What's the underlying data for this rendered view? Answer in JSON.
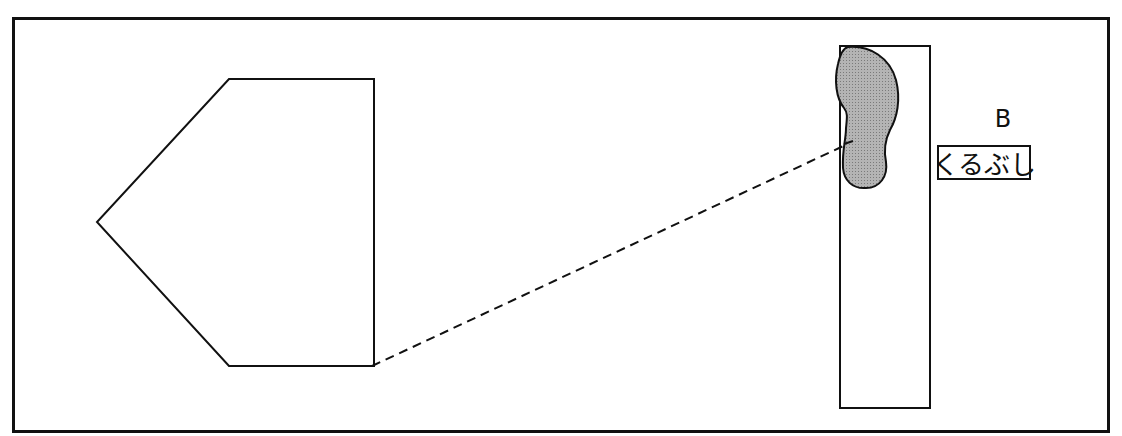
{
  "diagram": {
    "label": {
      "letter": "B",
      "text": "くるぶし"
    },
    "colors": {
      "stroke": "#111111",
      "footprint_fill": "#a8a8a8",
      "background": "#ffffff"
    },
    "shapes": {
      "outer_frame": "rectangle",
      "left_shape": "pentagon pointing left",
      "right_shape": "tall rectangle with footprint",
      "connector": "dashed line"
    }
  }
}
